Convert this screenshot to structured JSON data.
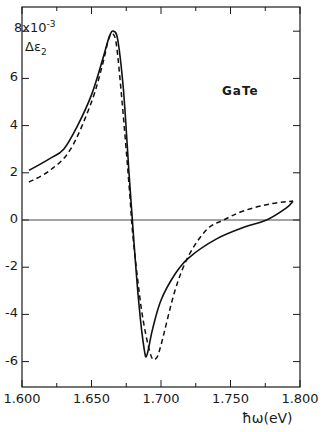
{
  "chart_data": {
    "type": "line",
    "title": "",
    "xlabel": "ħω(eV)",
    "ylabel": "Δε₂",
    "y_multiplier_label": "8x10⁻³",
    "xlim": [
      1.6,
      1.8
    ],
    "ylim": [
      -7,
      8.6
    ],
    "x_ticks": [
      "1.600",
      "1.650",
      "1.700",
      "1.750",
      "1.800"
    ],
    "y_ticks": [
      "6",
      "4",
      "2",
      "0",
      "-2",
      "-4",
      "-6"
    ],
    "y_tick_values": [
      8,
      6,
      4,
      2,
      0,
      -2,
      -4,
      -6
    ],
    "grid": false,
    "zero_line": true,
    "legend": "none",
    "annotations": [
      "GaTe"
    ],
    "series": [
      {
        "name": "solid",
        "style": "solid",
        "x": [
          1.605,
          1.62,
          1.63,
          1.64,
          1.65,
          1.658,
          1.663,
          1.666,
          1.669,
          1.673,
          1.677,
          1.68,
          1.684,
          1.688,
          1.69,
          1.694,
          1.7,
          1.71,
          1.72,
          1.74,
          1.76,
          1.776,
          1.79,
          1.795
        ],
        "values": [
          2.1,
          2.6,
          3.0,
          4.0,
          5.3,
          6.8,
          7.8,
          8.0,
          7.6,
          5.5,
          2.0,
          -0.5,
          -3.5,
          -5.5,
          -5.7,
          -4.6,
          -3.4,
          -2.3,
          -1.6,
          -0.8,
          -0.3,
          0.0,
          0.5,
          0.8
        ]
      },
      {
        "name": "dashed",
        "style": "dashed",
        "x": [
          1.605,
          1.62,
          1.635,
          1.65,
          1.658,
          1.662,
          1.665,
          1.668,
          1.672,
          1.677,
          1.68,
          1.686,
          1.692,
          1.696,
          1.7,
          1.71,
          1.72,
          1.733,
          1.745,
          1.76,
          1.78,
          1.795
        ],
        "values": [
          1.6,
          2.1,
          3.0,
          5.0,
          6.6,
          7.6,
          7.9,
          7.4,
          5.0,
          1.5,
          -0.8,
          -3.8,
          -5.6,
          -5.9,
          -5.3,
          -3.0,
          -1.5,
          -0.4,
          0.0,
          0.4,
          0.7,
          0.8
        ]
      }
    ]
  },
  "labels": {
    "y_top": "8x10",
    "y_top_exp": "-3",
    "y_name": "Δε",
    "y_name_sub": "2",
    "x_name": "ħω(eV)",
    "annotation": "GaTe"
  }
}
